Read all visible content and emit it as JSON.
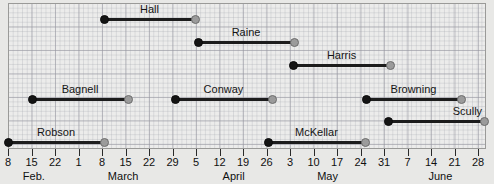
{
  "chart_data": {
    "type": "bar",
    "chart_style": "gantt",
    "title": "",
    "xlabel": "",
    "ylabel": "",
    "grid": true,
    "legend": "none",
    "axis": {
      "orientation": "horizontal",
      "unit": "week",
      "tick_labels": [
        "8",
        "15",
        "22",
        "1",
        "8",
        "15",
        "22",
        "29",
        "5",
        "12",
        "19",
        "26",
        "3",
        "10",
        "17",
        "24",
        "31",
        "7",
        "14",
        "21",
        "28"
      ],
      "tick_weeks": [
        0,
        1,
        2,
        3,
        4,
        5,
        6,
        7,
        8,
        9,
        10,
        11,
        12,
        13,
        14,
        15,
        16,
        17,
        18,
        19,
        20
      ],
      "range_weeks": [
        0,
        20
      ],
      "month_labels": [
        {
          "label": "Feb.",
          "week": 1.1
        },
        {
          "label": "March",
          "week": 4.9
        },
        {
          "label": "April",
          "week": 9.6
        },
        {
          "label": "May",
          "week": 13.6
        },
        {
          "label": "June",
          "week": 18.4
        }
      ]
    },
    "categories": [
      "Hall",
      "Raine",
      "Harris",
      "Bagnell",
      "Conway",
      "Browning",
      "Scully",
      "Robson",
      "McKellar"
    ],
    "tasks": [
      {
        "name": "Hall",
        "start_week": 4.08,
        "end_week": 7.96,
        "start_date": "March 8",
        "end_date": "April 5",
        "row": 0,
        "label_align": "center"
      },
      {
        "name": "Raine",
        "start_week": 8.09,
        "end_week": 12.17,
        "start_date": "April 5",
        "end_date": "May 3",
        "row": 1,
        "label_align": "center"
      },
      {
        "name": "Harris",
        "start_week": 12.13,
        "end_week": 16.26,
        "start_date": "May 3",
        "end_date": "May 31",
        "row": 2,
        "label_align": "center"
      },
      {
        "name": "Bagnell",
        "start_week": 1.02,
        "end_week": 5.11,
        "start_date": "Feb. 15",
        "end_date": "March 15",
        "row": 3,
        "label_align": "center"
      },
      {
        "name": "Conway",
        "start_week": 7.11,
        "end_week": 11.23,
        "start_date": "March 29",
        "end_date": "April 26",
        "row": 3,
        "label_align": "center"
      },
      {
        "name": "Browning",
        "start_week": 15.23,
        "end_week": 19.28,
        "start_date": "May 24",
        "end_date": "June 21",
        "row": 3,
        "label_align": "center"
      },
      {
        "name": "Scully",
        "start_week": 16.17,
        "end_week": 20.26,
        "start_date": "May 31",
        "end_date": "June 28",
        "row": 4,
        "label_align": "right"
      },
      {
        "name": "Robson",
        "start_week": 0.0,
        "end_week": 4.09,
        "start_date": "Feb. 8",
        "end_date": "March 8",
        "row": 5,
        "label_align": "center"
      },
      {
        "name": "McKellar",
        "start_week": 11.06,
        "end_week": 15.19,
        "start_date": "April 26",
        "end_date": "May 24",
        "row": 5,
        "label_align": "center"
      }
    ]
  }
}
